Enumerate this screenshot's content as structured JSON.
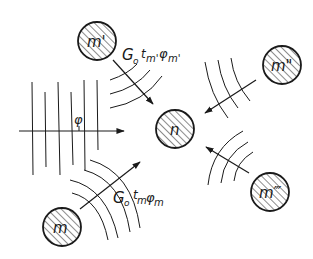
{
  "diagram": {
    "type": "field-interaction",
    "colors": {
      "ink": "#1a1a1a",
      "background": "#ffffff"
    },
    "nodes": [
      {
        "id": "m1",
        "label": "m'",
        "cx": 97,
        "cy": 41,
        "r": 19
      },
      {
        "id": "m2",
        "label": "m\"",
        "cx": 282,
        "cy": 65,
        "r": 19
      },
      {
        "id": "n",
        "label": "n",
        "cx": 175,
        "cy": 129,
        "r": 19
      },
      {
        "id": "m3",
        "label": "m'''",
        "cx": 270,
        "cy": 192,
        "r": 19
      },
      {
        "id": "m",
        "label": "m",
        "cx": 62,
        "cy": 227,
        "r": 19
      }
    ],
    "labels": {
      "top_formula": "G₀t_m'φ_m'",
      "plane_wave": "φ",
      "bottom_formula": "G₀t_mφ_m"
    },
    "label_parts": {
      "top": {
        "G": "G",
        "sub0": "o",
        "t": "t",
        "t_sub": "m'",
        "phi": "φ",
        "phi_sub": "m'"
      },
      "bottom": {
        "G": "G",
        "sub0": "o",
        "t": "t",
        "t_sub": "m",
        "phi": "φ",
        "phi_sub": "m"
      },
      "n": "n",
      "m1": "m'",
      "m2": "m\"",
      "m3": "m‴",
      "m": "m",
      "phi": "φ"
    }
  }
}
